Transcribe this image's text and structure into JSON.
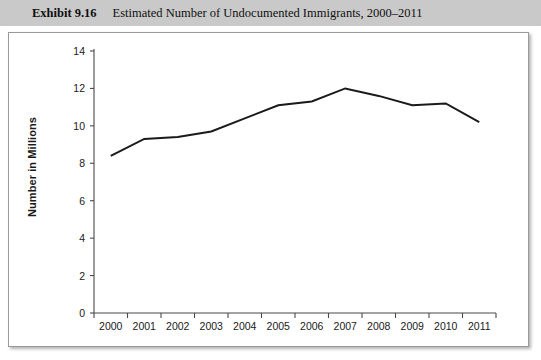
{
  "header": {
    "exhibit_number": "Exhibit 9.16",
    "title": "Estimated Number of Undocumented Immigrants, 2000–2011"
  },
  "chart_data": {
    "type": "line",
    "title": "Estimated Number of Undocumented Immigrants, 2000–2011",
    "xlabel": "",
    "ylabel": "Number in Millions",
    "categories": [
      "2000",
      "2001",
      "2002",
      "2003",
      "2004",
      "2005",
      "2006",
      "2007",
      "2008",
      "2009",
      "2010",
      "2011"
    ],
    "values": [
      8.4,
      9.3,
      9.4,
      9.7,
      10.4,
      11.1,
      11.3,
      12.0,
      11.6,
      11.1,
      11.2,
      10.2
    ],
    "ylim": [
      0,
      14
    ],
    "ytick_labels": [
      "0",
      "2",
      "4",
      "6",
      "8",
      "10",
      "12",
      "14"
    ],
    "ytick_values": [
      0,
      2,
      4,
      6,
      8,
      10,
      12,
      14
    ],
    "xtick_labels": [
      "2000",
      "2001",
      "2002",
      "2003",
      "2004",
      "2005",
      "2006",
      "2007",
      "2008",
      "2009",
      "2010",
      "2011"
    ],
    "grid": false,
    "legend": false,
    "legend_position": "none",
    "line_color": "#1a1a1a",
    "axis_color": "#4a4a4a"
  },
  "colors": {
    "header_band": "#c9c9c9",
    "panel_background": "#ffffff",
    "panel_border": "#9a9a9a",
    "text": "#101010"
  }
}
